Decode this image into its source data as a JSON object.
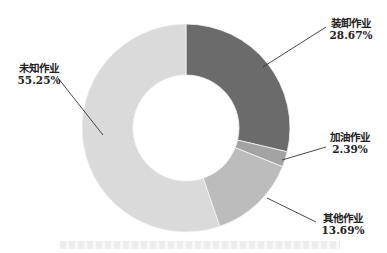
{
  "chart_data": {
    "type": "pie",
    "variant": "donut",
    "title": "",
    "start_angle_deg": 0,
    "direction": "clockwise",
    "slices": [
      {
        "label": "装卸作业",
        "value": 28.67,
        "value_label": "28.67%",
        "color": "#6b6b6b"
      },
      {
        "label": "加油作业",
        "value": 2.39,
        "value_label": "2.39%",
        "color": "#a3a3a3"
      },
      {
        "label": "其他作业",
        "value": 13.69,
        "value_label": "13.69%",
        "color": "#bcbcbc"
      },
      {
        "label": "未知作业",
        "value": 55.25,
        "value_label": "55.25%",
        "color": "#dadada"
      }
    ],
    "legend": "none",
    "data_labels": "outside with leader lines"
  },
  "labels": {
    "s0_name": "装卸作业",
    "s0_pct": "28.67%",
    "s1_name": "加油作业",
    "s1_pct": "2.39%",
    "s2_name": "其他作业",
    "s2_pct": "13.69%",
    "s3_name": "未知作业",
    "s3_pct": "55.25%"
  }
}
